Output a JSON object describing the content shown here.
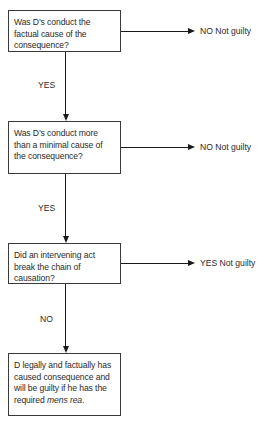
{
  "flowchart": {
    "nodes": [
      {
        "id": "q1",
        "type": "question",
        "text": "Was D’s conduct the factual cause of the consequence?"
      },
      {
        "id": "q2",
        "type": "question",
        "text": "Was D’s conduct more than a minimal cause of the consequence?"
      },
      {
        "id": "q3",
        "type": "question",
        "text": "Did an intervening act break the chain of causation?"
      },
      {
        "id": "result",
        "type": "conclusion",
        "text_main": "D legally and factually has caused consequence and will be guilty if he has the required ",
        "text_italic": "mens rea",
        "text_end": "."
      }
    ],
    "side_outcomes": [
      {
        "from": "q1",
        "label": "NO Not guilty"
      },
      {
        "from": "q2",
        "label": "NO Not guilty"
      },
      {
        "from": "q3",
        "label": "YES Not guilty"
      }
    ],
    "down_edges": [
      {
        "from": "q1",
        "to": "q2",
        "label": "YES"
      },
      {
        "from": "q2",
        "to": "q3",
        "label": "YES"
      },
      {
        "from": "q3",
        "to": "result",
        "label": "NO"
      }
    ]
  },
  "colors": {
    "line": "#1a1a1a",
    "box_border": "#3a3a3a",
    "text": "#2a2a2a",
    "background": "#ffffff"
  }
}
